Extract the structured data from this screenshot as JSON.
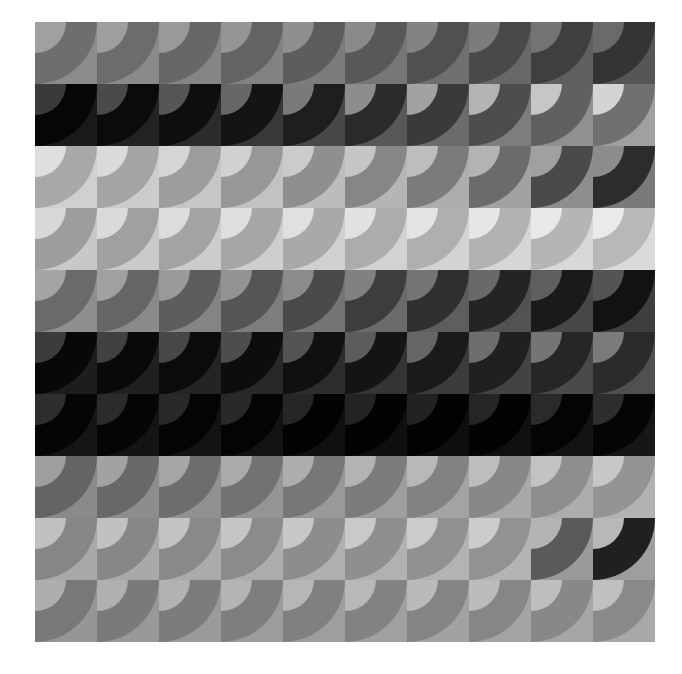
{
  "artwork": {
    "title": "Scallop Quarter-Disc Grid",
    "type": "generative-grid",
    "background_color": "#ffffff",
    "canvas": {
      "width": 682,
      "height": 674
    },
    "grid": {
      "origin_x": 35,
      "origin_y": 22,
      "cell_width": 62,
      "cell_height": 62,
      "columns": 10,
      "rows": 10,
      "total_width": 620,
      "total_height": 620
    },
    "motif": {
      "name": "quarter-disc-scallop",
      "layers": [
        "background-rect",
        "large-quarter-disc",
        "small-quarter-disc"
      ],
      "large_disc_anchor": "top-left",
      "large_disc_radius_ratio": 1.0,
      "small_disc_anchor": "top-left",
      "small_disc_radius_ratio": 0.5
    },
    "palette_note": "monochrome grayscale, values 0-255",
    "cells": [
      [
        {
          "bg": "#8c8c8c",
          "lg": "#6e6e6e",
          "sm": "#a0a0a0"
        },
        {
          "bg": "#8a8a8a",
          "lg": "#6c6c6c",
          "sm": "#9e9e9e"
        },
        {
          "bg": "#858585",
          "lg": "#676767",
          "sm": "#999999"
        },
        {
          "bg": "#828282",
          "lg": "#636363",
          "sm": "#959595"
        },
        {
          "bg": "#7c7c7c",
          "lg": "#5d5d5d",
          "sm": "#8f8f8f"
        },
        {
          "bg": "#767676",
          "lg": "#585858",
          "sm": "#8a8a8a"
        },
        {
          "bg": "#6f6f6f",
          "lg": "#505050",
          "sm": "#838383"
        },
        {
          "bg": "#686868",
          "lg": "#494949",
          "sm": "#7c7c7c"
        },
        {
          "bg": "#5f5f5f",
          "lg": "#3f3f3f",
          "sm": "#737373"
        },
        {
          "bg": "#565656",
          "lg": "#343434",
          "sm": "#6a6a6a"
        }
      ],
      [
        {
          "bg": "#1a1a1a",
          "lg": "#060606",
          "sm": "#3a3a3a"
        },
        {
          "bg": "#232323",
          "lg": "#0b0b0b",
          "sm": "#4a4a4a"
        },
        {
          "bg": "#2b2b2b",
          "lg": "#0e0e0e",
          "sm": "#565656"
        },
        {
          "bg": "#383838",
          "lg": "#141414",
          "sm": "#676767"
        },
        {
          "bg": "#484848",
          "lg": "#1e1e1e",
          "sm": "#7a7a7a"
        },
        {
          "bg": "#585858",
          "lg": "#2a2a2a",
          "sm": "#8d8d8d"
        },
        {
          "bg": "#6b6b6b",
          "lg": "#3a3a3a",
          "sm": "#a2a2a2"
        },
        {
          "bg": "#7d7d7d",
          "lg": "#4d4d4d",
          "sm": "#b4b4b4"
        },
        {
          "bg": "#909090",
          "lg": "#606060",
          "sm": "#c6c6c6"
        },
        {
          "bg": "#a0a0a0",
          "lg": "#707070",
          "sm": "#d4d4d4"
        }
      ],
      [
        {
          "bg": "#d0d0d0",
          "lg": "#a8a8a8",
          "sm": "#dedede"
        },
        {
          "bg": "#cccccc",
          "lg": "#a4a4a4",
          "sm": "#dadada"
        },
        {
          "bg": "#c6c6c6",
          "lg": "#9d9d9d",
          "sm": "#d5d5d5"
        },
        {
          "bg": "#c2c2c2",
          "lg": "#979797",
          "sm": "#d1d1d1"
        },
        {
          "bg": "#bcbcbc",
          "lg": "#8f8f8f",
          "sm": "#cbcbcb"
        },
        {
          "bg": "#b5b5b5",
          "lg": "#868686",
          "sm": "#c5c5c5"
        },
        {
          "bg": "#adadad",
          "lg": "#7b7b7b",
          "sm": "#bdbdbd"
        },
        {
          "bg": "#a2a2a2",
          "lg": "#6b6b6b",
          "sm": "#b3b3b3"
        },
        {
          "bg": "#8e8e8e",
          "lg": "#4a4a4a",
          "sm": "#a0a0a0"
        },
        {
          "bg": "#7a7a7a",
          "lg": "#2c2c2c",
          "sm": "#8c8c8c"
        }
      ],
      [
        {
          "bg": "#c8c8c8",
          "lg": "#9d9d9d",
          "sm": "#d8d8d8"
        },
        {
          "bg": "#cacaca",
          "lg": "#a0a0a0",
          "sm": "#dadada"
        },
        {
          "bg": "#cccccc",
          "lg": "#a3a3a3",
          "sm": "#dcdcdc"
        },
        {
          "bg": "#cecece",
          "lg": "#a6a6a6",
          "sm": "#dedede"
        },
        {
          "bg": "#d0d0d0",
          "lg": "#a9a9a9",
          "sm": "#e0e0e0"
        },
        {
          "bg": "#d2d2d2",
          "lg": "#acacac",
          "sm": "#e2e2e2"
        },
        {
          "bg": "#d4d4d4",
          "lg": "#afafaf",
          "sm": "#e4e4e4"
        },
        {
          "bg": "#d6d6d6",
          "lg": "#b2b2b2",
          "sm": "#e6e6e6"
        },
        {
          "bg": "#d8d8d8",
          "lg": "#b5b5b5",
          "sm": "#e8e8e8"
        },
        {
          "bg": "#dadada",
          "lg": "#b8b8b8",
          "sm": "#eaeaea"
        }
      ],
      [
        {
          "bg": "#8e8e8e",
          "lg": "#6a6a6a",
          "sm": "#a4a4a4"
        },
        {
          "bg": "#8a8a8a",
          "lg": "#656565",
          "sm": "#a0a0a0"
        },
        {
          "bg": "#848484",
          "lg": "#5d5d5d",
          "sm": "#9a9a9a"
        },
        {
          "bg": "#7d7d7d",
          "lg": "#555555",
          "sm": "#939393"
        },
        {
          "bg": "#757575",
          "lg": "#4a4a4a",
          "sm": "#8b8b8b"
        },
        {
          "bg": "#6a6a6a",
          "lg": "#3d3d3d",
          "sm": "#818181"
        },
        {
          "bg": "#5e5e5e",
          "lg": "#303030",
          "sm": "#757575"
        },
        {
          "bg": "#525252",
          "lg": "#242424",
          "sm": "#696969"
        },
        {
          "bg": "#484848",
          "lg": "#1a1a1a",
          "sm": "#5e5e5e"
        },
        {
          "bg": "#3e3e3e",
          "lg": "#121212",
          "sm": "#545454"
        }
      ],
      [
        {
          "bg": "#1d1d1d",
          "lg": "#080808",
          "sm": "#3c3c3c"
        },
        {
          "bg": "#202020",
          "lg": "#090909",
          "sm": "#414141"
        },
        {
          "bg": "#242424",
          "lg": "#0b0b0b",
          "sm": "#474747"
        },
        {
          "bg": "#282828",
          "lg": "#0d0d0d",
          "sm": "#4d4d4d"
        },
        {
          "bg": "#2d2d2d",
          "lg": "#101010",
          "sm": "#545454"
        },
        {
          "bg": "#343434",
          "lg": "#141414",
          "sm": "#5c5c5c"
        },
        {
          "bg": "#3c3c3c",
          "lg": "#1a1a1a",
          "sm": "#666666"
        },
        {
          "bg": "#434343",
          "lg": "#202020",
          "sm": "#6e6e6e"
        },
        {
          "bg": "#4a4a4a",
          "lg": "#262626",
          "sm": "#757575"
        },
        {
          "bg": "#505050",
          "lg": "#2b2b2b",
          "sm": "#7b7b7b"
        }
      ],
      [
        {
          "bg": "#161616",
          "lg": "#050505",
          "sm": "#2e2e2e"
        },
        {
          "bg": "#141414",
          "lg": "#050505",
          "sm": "#2b2b2b"
        },
        {
          "bg": "#131313",
          "lg": "#040404",
          "sm": "#292929"
        },
        {
          "bg": "#121212",
          "lg": "#040404",
          "sm": "#282828"
        },
        {
          "bg": "#101010",
          "lg": "#030303",
          "sm": "#262626"
        },
        {
          "bg": "#0f0f0f",
          "lg": "#030303",
          "sm": "#242424"
        },
        {
          "bg": "#0e0e0e",
          "lg": "#020202",
          "sm": "#222222"
        },
        {
          "bg": "#101010",
          "lg": "#030303",
          "sm": "#252525"
        },
        {
          "bg": "#131313",
          "lg": "#040404",
          "sm": "#2a2a2a"
        },
        {
          "bg": "#161616",
          "lg": "#050505",
          "sm": "#2e2e2e"
        }
      ],
      [
        {
          "bg": "#8a8a8a",
          "lg": "#646464",
          "sm": "#9e9e9e"
        },
        {
          "bg": "#8d8d8d",
          "lg": "#686868",
          "sm": "#a2a2a2"
        },
        {
          "bg": "#919191",
          "lg": "#6d6d6d",
          "sm": "#a6a6a6"
        },
        {
          "bg": "#959595",
          "lg": "#727272",
          "sm": "#aaaaaa"
        },
        {
          "bg": "#999999",
          "lg": "#777777",
          "sm": "#aeaeae"
        },
        {
          "bg": "#9e9e9e",
          "lg": "#7c7c7c",
          "sm": "#b3b3b3"
        },
        {
          "bg": "#a3a3a3",
          "lg": "#828282",
          "sm": "#b8b8b8"
        },
        {
          "bg": "#a8a8a8",
          "lg": "#888888",
          "sm": "#bdbdbd"
        },
        {
          "bg": "#adadad",
          "lg": "#8e8e8e",
          "sm": "#c2c2c2"
        },
        {
          "bg": "#b2b2b2",
          "lg": "#949494",
          "sm": "#c7c7c7"
        }
      ],
      [
        {
          "bg": "#a8a8a8",
          "lg": "#868686",
          "sm": "#c0c0c0"
        },
        {
          "bg": "#a9a9a9",
          "lg": "#878787",
          "sm": "#c1c1c1"
        },
        {
          "bg": "#ababab",
          "lg": "#898989",
          "sm": "#c3c3c3"
        },
        {
          "bg": "#adadad",
          "lg": "#8b8b8b",
          "sm": "#c5c5c5"
        },
        {
          "bg": "#afafaf",
          "lg": "#8d8d8d",
          "sm": "#c7c7c7"
        },
        {
          "bg": "#b1b1b1",
          "lg": "#8f8f8f",
          "sm": "#c9c9c9"
        },
        {
          "bg": "#b3b3b3",
          "lg": "#919191",
          "sm": "#cbcbcb"
        },
        {
          "bg": "#b4b4b4",
          "lg": "#929292",
          "sm": "#cccccc"
        },
        {
          "bg": "#9a9a9a",
          "lg": "#5a5a5a",
          "sm": "#b4b4b4"
        },
        {
          "bg": "#9e9e9e",
          "lg": "#202020",
          "sm": "#b8b8b8"
        }
      ],
      [
        {
          "bg": "#969696",
          "lg": "#787878",
          "sm": "#aeaeae"
        },
        {
          "bg": "#989898",
          "lg": "#7a7a7a",
          "sm": "#b0b0b0"
        },
        {
          "bg": "#9a9a9a",
          "lg": "#7c7c7c",
          "sm": "#b2b2b2"
        },
        {
          "bg": "#9c9c9c",
          "lg": "#7e7e7e",
          "sm": "#b4b4b4"
        },
        {
          "bg": "#9e9e9e",
          "lg": "#808080",
          "sm": "#b6b6b6"
        },
        {
          "bg": "#a0a0a0",
          "lg": "#828282",
          "sm": "#b8b8b8"
        },
        {
          "bg": "#a2a2a2",
          "lg": "#848484",
          "sm": "#bababa"
        },
        {
          "bg": "#a4a4a4",
          "lg": "#868686",
          "sm": "#bcbcbc"
        },
        {
          "bg": "#a6a6a6",
          "lg": "#888888",
          "sm": "#bebebe"
        },
        {
          "bg": "#a8a8a8",
          "lg": "#8a8a8a",
          "sm": "#c0c0c0"
        }
      ]
    ]
  }
}
